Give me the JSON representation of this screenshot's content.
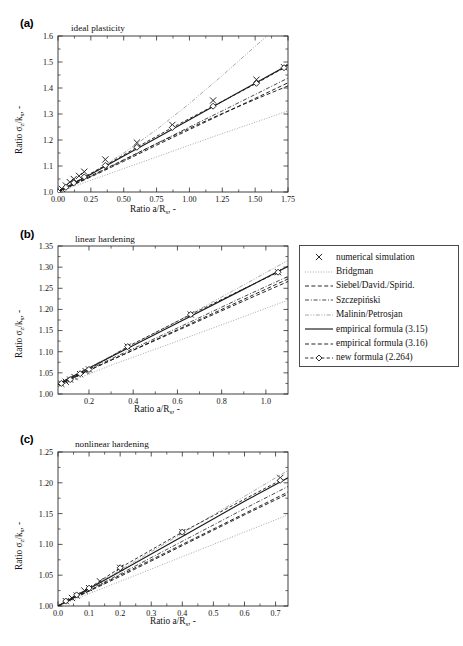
{
  "figure": {
    "panels": [
      {
        "tag": "(a)",
        "annotation": "ideal plasticity",
        "xlabel": "Ratio a/R",
        "xlabel_sub": "s",
        "xlabel_tail": ", -",
        "ylabel_head": "Ratio ",
        "ylabel_sym": "σ",
        "ylabel_sym_sub": "z",
        "ylabel_mid": "/k",
        "ylabel_sub2": "s",
        "ylabel_tail": ", -",
        "xticks": [
          "0.00",
          "0.25",
          "0.50",
          "0.75",
          "1.00",
          "1.25",
          "1.50",
          "1.75"
        ],
        "yticks": [
          "1.0",
          "1.1",
          "1.2",
          "1.3",
          "1.4",
          "1.5",
          "1.6"
        ],
        "xlim": [
          0.0,
          1.75
        ],
        "ylim": [
          1.0,
          1.6
        ]
      },
      {
        "tag": "(b)",
        "annotation": "linear hardening",
        "xlabel": "Ratio a/R",
        "xlabel_sub": "s",
        "xlabel_tail": ", -",
        "ylabel_head": "Ratio ",
        "ylabel_sym": "σ",
        "ylabel_sym_sub": "z",
        "ylabel_mid": "/k",
        "ylabel_sub2": "s",
        "ylabel_tail": ", -",
        "xticks": [
          "0.2",
          "0.4",
          "0.6",
          "0.8",
          "1.0"
        ],
        "yticks": [
          "1.00",
          "1.05",
          "1.10",
          "1.15",
          "1.20",
          "1.25",
          "1.30",
          "1.35"
        ],
        "xlim": [
          0.06,
          1.1
        ],
        "ylim": [
          1.0,
          1.35
        ]
      },
      {
        "tag": "(c)",
        "annotation": "nonlinear hardening",
        "xlabel": "Ratio a/R",
        "xlabel_sub": "s",
        "xlabel_tail": ", -",
        "ylabel_head": "Ratio ",
        "ylabel_sym": "σ",
        "ylabel_sym_sub": "z",
        "ylabel_mid": "/k",
        "ylabel_sub2": "s",
        "ylabel_tail": ", -",
        "xticks": [
          "0.0",
          "0.1",
          "0.2",
          "0.3",
          "0.4",
          "0.5",
          "0.6",
          "0.7"
        ],
        "yticks": [
          "1.00",
          "1.05",
          "1.10",
          "1.15",
          "1.20",
          "1.25"
        ],
        "xlim": [
          0.0,
          0.74
        ],
        "ylim": [
          1.0,
          1.25
        ]
      }
    ]
  },
  "legend": {
    "items": [
      {
        "label": "numerical simulation",
        "key": "cross-marker"
      },
      {
        "label": "Bridgman",
        "key": "dotted-line"
      },
      {
        "label": "Siebel/David./Spirid.",
        "key": "dashed-line"
      },
      {
        "label": "Szczepiński",
        "key": "dashdot-line"
      },
      {
        "label": "Malinin/Petrosjan",
        "key": "dashdotdot-line"
      },
      {
        "label": "empirical formula (3.15)",
        "key": "solid-line"
      },
      {
        "label": "empirical formula (3.16)",
        "key": "dashed-line"
      },
      {
        "label": "new formula (2.264)",
        "key": "diamond-dashed-line"
      }
    ]
  },
  "colors": {
    "axis": "#2b2b2b",
    "data": "#1a1a1a",
    "faint": "#8a8a8a",
    "background": "#ffffff"
  },
  "chart_data": {
    "type": "line",
    "title": "",
    "panels": [
      {
        "id": "a",
        "annotation": "ideal plasticity",
        "xlabel": "Ratio a/Rs, -",
        "ylabel": "Ratio sigma_z/k_s, -",
        "xlim": [
          0.0,
          1.75
        ],
        "ylim": [
          1.0,
          1.6
        ],
        "grid": false,
        "series": [
          {
            "name": "numerical simulation",
            "style": "cross-marker",
            "x": [
              0.0,
              0.03,
              0.06,
              0.09,
              0.12,
              0.16,
              0.2,
              0.36,
              0.6,
              0.87,
              1.18,
              1.51,
              1.72
            ],
            "y": [
              1.0,
              1.012,
              1.025,
              1.038,
              1.05,
              1.062,
              1.078,
              1.125,
              1.19,
              1.258,
              1.352,
              1.432,
              1.48
            ]
          },
          {
            "name": "Bridgman",
            "style": "dotted-line",
            "x": [
              0.0,
              0.25,
              0.5,
              0.75,
              1.0,
              1.25,
              1.5,
              1.75
            ],
            "y": [
              1.0,
              1.045,
              1.09,
              1.135,
              1.18,
              1.225,
              1.268,
              1.312
            ]
          },
          {
            "name": "Siebel/David./Spirid.",
            "style": "dashed-line",
            "x": [
              0.0,
              0.25,
              0.5,
              0.75,
              1.0,
              1.25,
              1.5,
              1.75
            ],
            "y": [
              1.0,
              1.058,
              1.118,
              1.18,
              1.24,
              1.3,
              1.36,
              1.42
            ]
          },
          {
            "name": "Szczepiński",
            "style": "dashdot-line",
            "x": [
              0.0,
              0.25,
              0.5,
              0.75,
              1.0,
              1.25,
              1.5,
              1.75
            ],
            "y": [
              1.0,
              1.06,
              1.122,
              1.186,
              1.25,
              1.312,
              1.375,
              1.438
            ]
          },
          {
            "name": "Malinin/Petrosjan",
            "style": "dashdotdot-line",
            "x": [
              0.0,
              0.25,
              0.5,
              0.75,
              1.0,
              1.25,
              1.5,
              1.75
            ],
            "y": [
              1.0,
              1.07,
              1.15,
              1.24,
              1.34,
              1.448,
              1.56,
              1.672
            ]
          },
          {
            "name": "empirical formula (3.15)",
            "style": "solid-line",
            "x": [
              0.0,
              0.25,
              0.5,
              0.75,
              1.0,
              1.25,
              1.5,
              1.75
            ],
            "y": [
              1.0,
              1.068,
              1.138,
              1.208,
              1.278,
              1.348,
              1.418,
              1.488
            ]
          },
          {
            "name": "empirical formula (3.16)",
            "style": "dashed-line",
            "x": [
              0.0,
              0.25,
              0.5,
              0.75,
              1.0,
              1.25,
              1.5,
              1.75
            ],
            "y": [
              1.0,
              1.062,
              1.124,
              1.186,
              1.245,
              1.302,
              1.356,
              1.408
            ]
          },
          {
            "name": "new formula (2.264)",
            "style": "diamond-dashed-line",
            "x": [
              0.0,
              0.06,
              0.12,
              0.2,
              0.36,
              0.6,
              0.87,
              1.18,
              1.51,
              1.72
            ],
            "y": [
              1.0,
              1.018,
              1.035,
              1.058,
              1.102,
              1.172,
              1.248,
              1.33,
              1.418,
              1.478
            ]
          }
        ]
      },
      {
        "id": "b",
        "annotation": "linear hardening",
        "xlabel": "Ratio a/Rs, -",
        "ylabel": "Ratio sigma_z/k_s, -",
        "xlim": [
          0.06,
          1.1
        ],
        "ylim": [
          1.0,
          1.35
        ],
        "grid": false,
        "series": [
          {
            "name": "numerical simulation",
            "style": "cross-marker",
            "x": [
              0.075,
              0.095,
              0.115,
              0.135,
              0.16,
              0.185,
              0.2,
              0.375,
              0.66,
              1.055
            ],
            "y": [
              1.024,
              1.029,
              1.034,
              1.04,
              1.047,
              1.054,
              1.058,
              1.112,
              1.188,
              1.288
            ]
          },
          {
            "name": "Bridgman",
            "style": "dotted-line",
            "x": [
              0.06,
              0.3,
              0.6,
              0.9,
              1.1
            ],
            "y": [
              1.018,
              1.068,
              1.125,
              1.183,
              1.222
            ]
          },
          {
            "name": "Siebel/David./Spirid.",
            "style": "dashed-line",
            "x": [
              0.06,
              0.3,
              0.6,
              0.9,
              1.1
            ],
            "y": [
              1.022,
              1.08,
              1.15,
              1.22,
              1.266
            ]
          },
          {
            "name": "Szczepiński",
            "style": "dashdot-line",
            "x": [
              0.06,
              0.3,
              0.6,
              0.9,
              1.1
            ],
            "y": [
              1.023,
              1.083,
              1.156,
              1.23,
              1.278
            ]
          },
          {
            "name": "Malinin/Petrosjan",
            "style": "dashdotdot-line",
            "x": [
              0.06,
              0.3,
              0.6,
              0.9,
              1.1
            ],
            "y": [
              1.025,
              1.09,
              1.172,
              1.258,
              1.316
            ]
          },
          {
            "name": "empirical formula (3.15)",
            "style": "solid-line",
            "x": [
              0.06,
              0.3,
              0.6,
              0.9,
              1.1
            ],
            "y": [
              1.024,
              1.088,
              1.168,
              1.248,
              1.302
            ]
          },
          {
            "name": "empirical formula (3.16)",
            "style": "dashed-line",
            "x": [
              0.06,
              0.3,
              0.6,
              0.9,
              1.1
            ],
            "y": [
              1.022,
              1.08,
              1.152,
              1.224,
              1.272
            ]
          },
          {
            "name": "new formula (2.264)",
            "style": "diamond-dashed-line",
            "x": [
              0.075,
              0.115,
              0.16,
              0.2,
              0.375,
              0.66,
              1.055
            ],
            "y": [
              1.025,
              1.034,
              1.048,
              1.058,
              1.112,
              1.188,
              1.288
            ]
          }
        ]
      },
      {
        "id": "c",
        "annotation": "nonlinear hardening",
        "xlabel": "Ratio a/Rs, -",
        "ylabel": "Ratio sigma_z/k_s, -",
        "xlim": [
          0.0,
          0.74
        ],
        "ylim": [
          1.0,
          1.25
        ],
        "grid": false,
        "series": [
          {
            "name": "numerical simulation",
            "style": "cross-marker",
            "x": [
              0.025,
              0.045,
              0.06,
              0.085,
              0.1,
              0.135,
              0.2,
              0.4,
              0.715
            ],
            "y": [
              1.008,
              1.013,
              1.017,
              1.025,
              1.029,
              1.04,
              1.062,
              1.12,
              1.208
            ]
          },
          {
            "name": "Bridgman",
            "style": "dotted-line",
            "x": [
              0.0,
              0.2,
              0.4,
              0.6,
              0.74
            ],
            "y": [
              1.0,
              1.04,
              1.08,
              1.12,
              1.148
            ]
          },
          {
            "name": "Siebel/David./Spirid.",
            "style": "dashed-line",
            "x": [
              0.0,
              0.2,
              0.4,
              0.6,
              0.74
            ],
            "y": [
              1.0,
              1.048,
              1.098,
              1.148,
              1.182
            ]
          },
          {
            "name": "Szczepiński",
            "style": "dashdot-line",
            "x": [
              0.0,
              0.2,
              0.4,
              0.6,
              0.74
            ],
            "y": [
              1.0,
              1.052,
              1.105,
              1.158,
              1.194
            ]
          },
          {
            "name": "Malinin/Petrosjan",
            "style": "dashdotdot-line",
            "x": [
              0.0,
              0.2,
              0.4,
              0.6,
              0.74
            ],
            "y": [
              1.0,
              1.058,
              1.118,
              1.178,
              1.22
            ]
          },
          {
            "name": "empirical formula (3.15)",
            "style": "solid-line",
            "x": [
              0.0,
              0.2,
              0.4,
              0.6,
              0.74
            ],
            "y": [
              1.0,
              1.056,
              1.113,
              1.17,
              1.208
            ]
          },
          {
            "name": "empirical formula (3.16)",
            "style": "dashed-line",
            "x": [
              0.0,
              0.2,
              0.4,
              0.6,
              0.74
            ],
            "y": [
              1.0,
              1.05,
              1.1,
              1.15,
              1.185
            ]
          },
          {
            "name": "new formula (2.264)",
            "style": "diamond-dashed-line",
            "x": [
              0.025,
              0.06,
              0.1,
              0.2,
              0.4,
              0.715
            ],
            "y": [
              1.008,
              1.018,
              1.029,
              1.062,
              1.12,
              1.204
            ]
          }
        ]
      }
    ]
  }
}
